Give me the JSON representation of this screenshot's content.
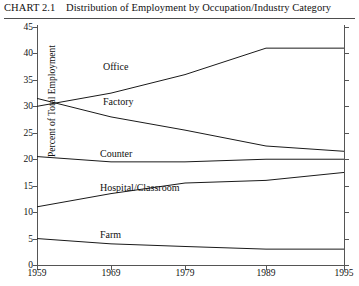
{
  "header": {
    "chart_number": "CHART 2.1",
    "title": "Distribution of Employment by Occupation/Industry Category"
  },
  "chart_data": {
    "type": "line",
    "title": "Distribution of Employment by Occupation/Industry Category",
    "xlabel": "",
    "ylabel": "Percent of Total Employment",
    "x": [
      1959,
      1969,
      1979,
      1989,
      1995
    ],
    "xtick_labels": [
      "1959",
      "1969",
      "1979",
      "1989",
      "1995"
    ],
    "ytick_labels": [
      "0",
      "5",
      "10",
      "15",
      "20",
      "25",
      "30",
      "35",
      "40",
      "45"
    ],
    "yticks": [
      0,
      5,
      10,
      15,
      20,
      25,
      30,
      35,
      40,
      45
    ],
    "ylim": [
      0,
      45
    ],
    "xlim": [
      1959,
      1995
    ],
    "grid": false,
    "legend": "inline-labels",
    "series": [
      {
        "name": "Office",
        "values": [
          30.0,
          32.5,
          36.0,
          41.0,
          41.0
        ]
      },
      {
        "name": "Factory",
        "values": [
          31.5,
          28.0,
          25.5,
          22.5,
          21.5
        ]
      },
      {
        "name": "Counter",
        "values": [
          20.5,
          19.5,
          19.5,
          20.0,
          20.0
        ]
      },
      {
        "name": "Hospital/Classroom",
        "values": [
          11.0,
          13.5,
          15.5,
          16.0,
          17.5
        ]
      },
      {
        "name": "Farm",
        "values": [
          5.0,
          4.0,
          3.5,
          3.0,
          3.0
        ]
      }
    ]
  }
}
